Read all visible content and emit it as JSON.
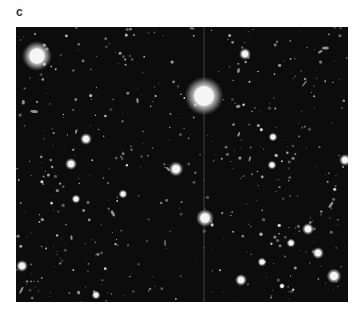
{
  "figure": {
    "panel_label": "c",
    "image": {
      "subject": "deep-field astronomical image of stars and galaxies",
      "background_color": "#0c0c0c",
      "bright_stars": [
        {
          "x": 21,
          "y": 29,
          "r": 10,
          "spike": false
        },
        {
          "x": 188,
          "y": 69,
          "r": 13,
          "spike": true
        },
        {
          "x": 189,
          "y": 191,
          "r": 6,
          "spike": false
        },
        {
          "x": 229,
          "y": 27,
          "r": 4,
          "spike": false
        },
        {
          "x": 70,
          "y": 112,
          "r": 4,
          "spike": false
        },
        {
          "x": 55,
          "y": 137,
          "r": 4,
          "spike": false
        },
        {
          "x": 160,
          "y": 142,
          "r": 5,
          "spike": false
        },
        {
          "x": 292,
          "y": 202,
          "r": 4,
          "spike": false
        },
        {
          "x": 302,
          "y": 226,
          "r": 4,
          "spike": false
        },
        {
          "x": 318,
          "y": 249,
          "r": 5,
          "spike": false
        },
        {
          "x": 275,
          "y": 216,
          "r": 3,
          "spike": false
        },
        {
          "x": 246,
          "y": 235,
          "r": 3,
          "spike": false
        },
        {
          "x": 266,
          "y": 259,
          "r": 2,
          "spike": false
        },
        {
          "x": 257,
          "y": 110,
          "r": 3,
          "spike": false
        },
        {
          "x": 256,
          "y": 138,
          "r": 3,
          "spike": false
        },
        {
          "x": 329,
          "y": 133,
          "r": 4,
          "spike": false
        },
        {
          "x": 6,
          "y": 239,
          "r": 4,
          "spike": false
        },
        {
          "x": 60,
          "y": 172,
          "r": 3,
          "spike": false
        },
        {
          "x": 107,
          "y": 167,
          "r": 3,
          "spike": false
        },
        {
          "x": 80,
          "y": 268,
          "r": 3,
          "spike": false
        },
        {
          "x": 225,
          "y": 253,
          "r": 4,
          "spike": false
        }
      ]
    }
  }
}
